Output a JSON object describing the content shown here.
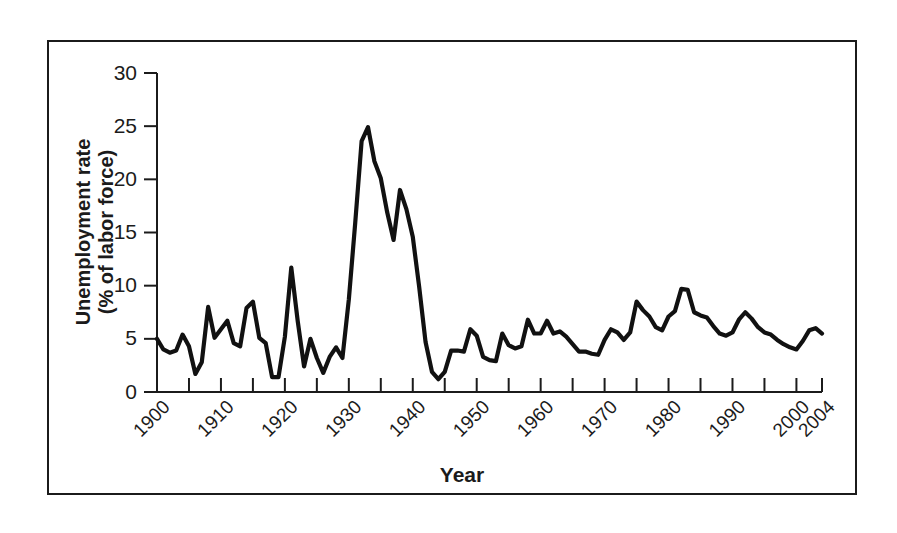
{
  "chart_data": {
    "type": "line",
    "title": "",
    "xlabel": "Year",
    "ylabel": "Unemployment rate\n(% of labor force)",
    "ylabel_line1": "Unemployment rate",
    "ylabel_line2": "(% of labor force)",
    "xlim": [
      1900,
      2004
    ],
    "ylim": [
      0,
      30
    ],
    "ytick_labels": [
      "0",
      "5",
      "10",
      "15",
      "20",
      "25",
      "30"
    ],
    "ytick_values": [
      0,
      5,
      10,
      15,
      20,
      25,
      30
    ],
    "xtick_labels": [
      "1900",
      "1910",
      "1920",
      "1930",
      "1940",
      "1950",
      "1960",
      "1970",
      "1980",
      "1990",
      "2000",
      "2004"
    ],
    "xtick_values": [
      1900,
      1910,
      1920,
      1930,
      1940,
      1950,
      1960,
      1970,
      1980,
      1990,
      2000,
      2004
    ],
    "xminor_ticks": [
      1905,
      1915,
      1925,
      1935,
      1945,
      1955,
      1965,
      1975,
      1985,
      1995
    ],
    "grid": false,
    "legend": false,
    "line_color": "#111111",
    "axis_color": "#1b1b1b",
    "series": [
      {
        "name": "Unemployment rate",
        "x": [
          1900,
          1901,
          1902,
          1903,
          1904,
          1905,
          1906,
          1907,
          1908,
          1909,
          1910,
          1911,
          1912,
          1913,
          1914,
          1915,
          1916,
          1917,
          1918,
          1919,
          1920,
          1921,
          1922,
          1923,
          1924,
          1925,
          1926,
          1927,
          1928,
          1929,
          1930,
          1931,
          1932,
          1933,
          1934,
          1935,
          1936,
          1937,
          1938,
          1939,
          1940,
          1941,
          1942,
          1943,
          1944,
          1945,
          1946,
          1947,
          1948,
          1949,
          1950,
          1951,
          1952,
          1953,
          1954,
          1955,
          1956,
          1957,
          1958,
          1959,
          1960,
          1961,
          1962,
          1963,
          1964,
          1965,
          1966,
          1967,
          1968,
          1969,
          1970,
          1971,
          1972,
          1973,
          1974,
          1975,
          1976,
          1977,
          1978,
          1979,
          1980,
          1981,
          1982,
          1983,
          1984,
          1985,
          1986,
          1987,
          1988,
          1989,
          1990,
          1991,
          1992,
          1993,
          1994,
          1995,
          1996,
          1997,
          1998,
          1999,
          2000,
          2001,
          2002,
          2003,
          2004
        ],
        "values": [
          5.0,
          4.0,
          3.7,
          3.9,
          5.4,
          4.3,
          1.7,
          2.8,
          8.0,
          5.1,
          5.9,
          6.7,
          4.6,
          4.3,
          7.9,
          8.5,
          5.1,
          4.6,
          1.4,
          1.4,
          5.2,
          11.7,
          6.7,
          2.4,
          5.0,
          3.2,
          1.8,
          3.3,
          4.2,
          3.2,
          8.7,
          15.9,
          23.6,
          24.9,
          21.7,
          20.1,
          16.9,
          14.3,
          19.0,
          17.2,
          14.6,
          9.9,
          4.7,
          1.9,
          1.2,
          1.9,
          3.9,
          3.9,
          3.8,
          5.9,
          5.3,
          3.3,
          3.0,
          2.9,
          5.5,
          4.4,
          4.1,
          4.3,
          6.8,
          5.5,
          5.5,
          6.7,
          5.5,
          5.7,
          5.2,
          4.5,
          3.8,
          3.8,
          3.6,
          3.5,
          4.9,
          5.9,
          5.6,
          4.9,
          5.6,
          8.5,
          7.7,
          7.1,
          6.1,
          5.8,
          7.1,
          7.6,
          9.7,
          9.6,
          7.5,
          7.2,
          7.0,
          6.2,
          5.5,
          5.3,
          5.6,
          6.8,
          7.5,
          6.9,
          6.1,
          5.6,
          5.4,
          4.9,
          4.5,
          4.2,
          4.0,
          4.8,
          5.8,
          6.0,
          5.5
        ]
      }
    ]
  }
}
